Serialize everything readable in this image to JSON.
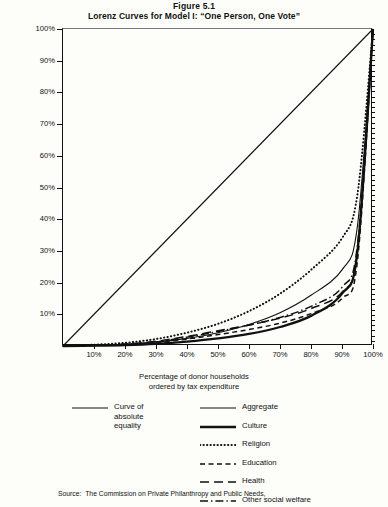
{
  "figure": {
    "number": "Figure 5.1",
    "title": "Lorenz Curves for Model I:  “One Person, One Vote”"
  },
  "source": {
    "label": "Source:",
    "text": "The Commission on Private Philanthropy and Public Needs,"
  },
  "legend": {
    "left": [
      {
        "name": "equality",
        "label": "Curve of\nabsolute\nequality",
        "style": "solid-thin"
      }
    ],
    "right": [
      {
        "name": "aggregate",
        "label": "Aggregate",
        "style": "solid-thin"
      },
      {
        "name": "culture",
        "label": "Culture",
        "style": "solid-thick"
      },
      {
        "name": "religion",
        "label": "Religion",
        "style": "dotted"
      },
      {
        "name": "education",
        "label": "Education",
        "style": "dashed"
      },
      {
        "name": "health",
        "label": "Health",
        "style": "long-dash"
      },
      {
        "name": "other-social-welfare",
        "label": "Other social welfare",
        "style": "dash-dot"
      }
    ]
  },
  "chart_data": {
    "type": "line",
    "title": "Lorenz Curves for Model I:  “One Person, One Vote”",
    "subtitle": "Figure 5.1",
    "xlabel": "Percentage of donor households\nordered by tax expenditure",
    "ylabel": "Percentage of total tax expenditure\nfor each sector",
    "xlim": [
      0,
      100
    ],
    "ylim": [
      0,
      100
    ],
    "grid": false,
    "legend_position": "below",
    "xticks": [
      "10%",
      "20%",
      "30%",
      "40%",
      "50%",
      "60%",
      "70%",
      "80%",
      "90%",
      "100%"
    ],
    "yticks": [
      "10%",
      "20%",
      "30%",
      "40%",
      "50%",
      "60%",
      "70%",
      "80%",
      "90%",
      "100%"
    ],
    "x": [
      0,
      10,
      20,
      30,
      40,
      50,
      60,
      70,
      80,
      90,
      95,
      100
    ],
    "series": [
      {
        "name": "Curve of absolute equality",
        "style": "solid-thin",
        "values": [
          0,
          10,
          20,
          30,
          40,
          50,
          60,
          70,
          80,
          90,
          95,
          100
        ]
      },
      {
        "name": "Religion",
        "style": "dotted",
        "values": [
          0,
          0.4,
          1.0,
          2.2,
          4.2,
          7.0,
          11.0,
          16.5,
          24.0,
          34.0,
          48.0,
          100
        ]
      },
      {
        "name": "Aggregate",
        "style": "solid-thin",
        "values": [
          0,
          0.2,
          0.5,
          1.2,
          2.4,
          4.2,
          6.8,
          10.5,
          16.0,
          24.0,
          38.0,
          100
        ]
      },
      {
        "name": "Culture",
        "style": "solid-thick",
        "values": [
          0,
          0.1,
          0.3,
          0.7,
          1.4,
          2.4,
          3.8,
          6.0,
          9.5,
          16.5,
          30.0,
          100
        ]
      },
      {
        "name": "Other social welfare",
        "style": "dash-dot",
        "values": [
          0,
          0.2,
          0.5,
          1.3,
          2.8,
          4.6,
          6.6,
          9.0,
          12.5,
          18.5,
          32.0,
          100
        ]
      },
      {
        "name": "Health",
        "style": "long-dash",
        "values": [
          0,
          0.2,
          0.6,
          1.5,
          3.0,
          4.8,
          6.6,
          8.8,
          11.8,
          17.0,
          30.0,
          100
        ]
      },
      {
        "name": "Education",
        "style": "dashed",
        "values": [
          0,
          0.2,
          0.5,
          1.1,
          2.2,
          3.6,
          5.2,
          7.2,
          10.2,
          15.0,
          27.0,
          100
        ]
      }
    ]
  }
}
